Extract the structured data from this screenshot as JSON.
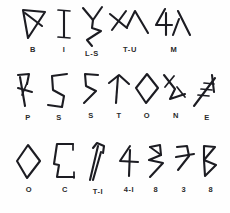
{
  "sheet": {
    "title": "Glyph Transliteration Chart",
    "background_color": "#fefefe",
    "ink_color": "#1c1c22",
    "label_color": "#2b2b2b"
  },
  "rows": [
    {
      "row_index": 1,
      "transliteration": "B I L-S T-U M",
      "glyphs": [
        {
          "label": "B",
          "icon": "down-triangle-with-diagonal-glyph",
          "x": 16,
          "width": 34
        },
        {
          "label": "I",
          "icon": "i-bar-glyph",
          "x": 50,
          "width": 28
        },
        {
          "label": "L-S",
          "icon": "zigzag-fork-glyph",
          "x": 76,
          "width": 34
        },
        {
          "label": "T-U",
          "icon": "cross-lambda-pair-glyph",
          "x": 108,
          "width": 44
        },
        {
          "label": "M",
          "icon": "four-lambda-pair-glyph",
          "x": 152,
          "width": 42
        }
      ]
    },
    {
      "row_index": 2,
      "transliteration": "P S S T O N E",
      "glyphs": [
        {
          "label": "P",
          "icon": "hooked-stem-with-bar-glyph",
          "x": 12,
          "width": 32
        },
        {
          "label": "S",
          "icon": "angular-s-glyph",
          "x": 44,
          "width": 32
        },
        {
          "label": "S",
          "icon": "angular-five-glyph",
          "x": 76,
          "width": 30
        },
        {
          "label": "T",
          "icon": "slanted-tee-glyph",
          "x": 104,
          "width": 30
        },
        {
          "label": "O",
          "icon": "diamond-glyph",
          "x": 132,
          "width": 30
        },
        {
          "label": "N",
          "icon": "crossed-zigzag-glyph",
          "x": 160,
          "width": 32
        },
        {
          "label": "E",
          "icon": "hatched-diagonal-glyph",
          "x": 190,
          "width": 34
        }
      ]
    },
    {
      "row_index": 3,
      "transliteration": "O C T-I 4-I 8 3 8",
      "glyphs": [
        {
          "label": "O",
          "icon": "diamond-glyph",
          "x": 12,
          "width": 34
        },
        {
          "label": "C",
          "icon": "bracket-c-glyph",
          "x": 48,
          "width": 34
        },
        {
          "label": "T-I",
          "icon": "hooked-mast-glyph",
          "x": 82,
          "width": 34
        },
        {
          "label": "4-I",
          "icon": "four-with-stem-glyph",
          "x": 114,
          "width": 30
        },
        {
          "label": "8",
          "icon": "broken-eight-glyph",
          "x": 142,
          "width": 28
        },
        {
          "label": "3",
          "icon": "barred-three-glyph",
          "x": 170,
          "width": 28
        },
        {
          "label": "8",
          "icon": "double-triangle-eight-glyph",
          "x": 196,
          "width": 30
        }
      ]
    }
  ]
}
